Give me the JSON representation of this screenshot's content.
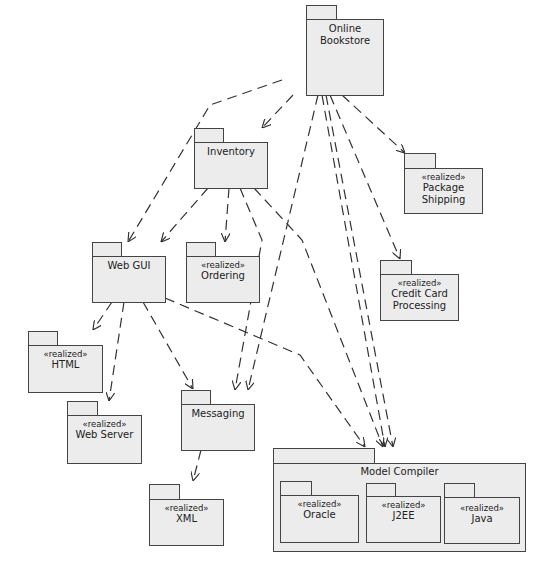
{
  "diagram": {
    "type": "UML package diagram",
    "colors": {
      "fill": "#ececec",
      "stroke": "#444444",
      "edge": "#333333"
    },
    "packages": [
      {
        "id": "online-bookstore",
        "name": "Online Bookstore",
        "stereotype": ""
      },
      {
        "id": "inventory",
        "name": "Inventory",
        "stereotype": ""
      },
      {
        "id": "package-shipping",
        "name": "Package Shipping",
        "stereotype": "«realized»"
      },
      {
        "id": "web-gui",
        "name": "Web GUI",
        "stereotype": ""
      },
      {
        "id": "ordering",
        "name": "Ordering",
        "stereotype": "«realized»"
      },
      {
        "id": "credit-card",
        "name": "Credit Card Processing",
        "stereotype": "«realized»"
      },
      {
        "id": "html",
        "name": "HTML",
        "stereotype": "«realized»"
      },
      {
        "id": "web-server",
        "name": "Web Server",
        "stereotype": "«realized»"
      },
      {
        "id": "messaging",
        "name": "Messaging",
        "stereotype": ""
      },
      {
        "id": "xml",
        "name": "XML",
        "stereotype": "«realized»"
      },
      {
        "id": "model-compiler",
        "name": "Model Compiler",
        "stereotype": ""
      },
      {
        "id": "oracle",
        "name": "Oracle",
        "stereotype": "«realized»"
      },
      {
        "id": "j2ee",
        "name": "J2EE",
        "stereotype": "«realized»"
      },
      {
        "id": "java",
        "name": "Java",
        "stereotype": "«realized»"
      }
    ],
    "dependencies": [
      {
        "from": "Online Bookstore",
        "to": "Web GUI"
      },
      {
        "from": "Online Bookstore",
        "to": "Inventory"
      },
      {
        "from": "Online Bookstore",
        "to": "Package Shipping"
      },
      {
        "from": "Online Bookstore",
        "to": "Credit Card Processing"
      },
      {
        "from": "Online Bookstore",
        "to": "Messaging"
      },
      {
        "from": "Online Bookstore",
        "to": "Model Compiler"
      },
      {
        "from": "Online Bookstore",
        "to": "Model Compiler"
      },
      {
        "from": "Inventory",
        "to": "Web GUI"
      },
      {
        "from": "Inventory",
        "to": "Ordering"
      },
      {
        "from": "Inventory",
        "to": "Messaging"
      },
      {
        "from": "Inventory",
        "to": "Model Compiler"
      },
      {
        "from": "Web GUI",
        "to": "HTML"
      },
      {
        "from": "Web GUI",
        "to": "Web Server"
      },
      {
        "from": "Web GUI",
        "to": "Messaging"
      },
      {
        "from": "Web GUI",
        "to": "Model Compiler"
      },
      {
        "from": "Messaging",
        "to": "XML"
      }
    ]
  }
}
